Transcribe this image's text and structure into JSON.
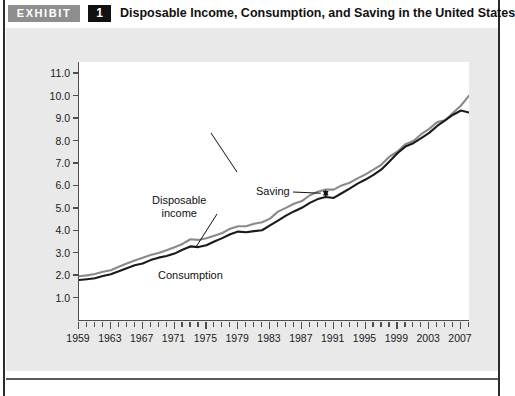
{
  "header": {
    "exhibit_label": "EXHIBIT",
    "exhibit_number": "1",
    "title": "Disposable Income, Consumption, and Saving in the United States"
  },
  "colors": {
    "panel_background": "#e9e9e9",
    "plot_background": "#ffffff",
    "axis": "#4d4d4d",
    "disposable_income_line": "#8a8a8a",
    "consumption_line": "#1a1a1a",
    "exhibit_badge": "#8e8e8e",
    "number_badge": "#111111",
    "text": "#1a1a1a"
  },
  "chart_data": {
    "type": "line",
    "title": "Disposable Income, Consumption, and Saving in the United States",
    "xlabel": "",
    "ylabel": "Trillions of 2005 dollars",
    "xlim": [
      1959,
      2008
    ],
    "ylim": [
      0.0,
      11.5
    ],
    "grid": false,
    "legend_position": "inline-annotations",
    "y_ticks": [
      "1.0",
      "2.0",
      "3.0",
      "4.0",
      "5.0",
      "6.0",
      "7.0",
      "8.0",
      "9.0",
      "10.0",
      "11.0"
    ],
    "y_tick_values": [
      1.0,
      2.0,
      3.0,
      4.0,
      5.0,
      6.0,
      7.0,
      8.0,
      9.0,
      10.0,
      11.0
    ],
    "x_ticks": [
      "1959",
      "1963",
      "1967",
      "1971",
      "1975",
      "1979",
      "1983",
      "1987",
      "1991",
      "1995",
      "1999",
      "2003",
      "2007"
    ],
    "x_tick_values": [
      1959,
      1963,
      1967,
      1971,
      1975,
      1979,
      1983,
      1987,
      1991,
      1995,
      1999,
      2003,
      2007
    ],
    "x_minor_tick_interval": 1,
    "x": [
      1959,
      1960,
      1961,
      1962,
      1963,
      1964,
      1965,
      1966,
      1967,
      1968,
      1969,
      1970,
      1971,
      1972,
      1973,
      1974,
      1975,
      1976,
      1977,
      1978,
      1979,
      1980,
      1981,
      1982,
      1983,
      1984,
      1985,
      1986,
      1987,
      1988,
      1989,
      1990,
      1991,
      1992,
      1993,
      1994,
      1995,
      1996,
      1997,
      1998,
      1999,
      2000,
      2001,
      2002,
      2003,
      2004,
      2005,
      2006,
      2007,
      2008
    ],
    "series": [
      {
        "name": "Disposable income",
        "color": "#8a8a8a",
        "values": [
          1.95,
          1.99,
          2.05,
          2.15,
          2.22,
          2.37,
          2.52,
          2.65,
          2.77,
          2.9,
          2.99,
          3.11,
          3.24,
          3.39,
          3.6,
          3.57,
          3.64,
          3.76,
          3.88,
          4.07,
          4.18,
          4.18,
          4.29,
          4.36,
          4.52,
          4.83,
          5.0,
          5.18,
          5.3,
          5.56,
          5.72,
          5.82,
          5.81,
          6.0,
          6.12,
          6.31,
          6.49,
          6.7,
          6.93,
          7.28,
          7.5,
          7.83,
          7.98,
          8.28,
          8.52,
          8.82,
          8.9,
          9.24,
          9.56,
          10.0
        ],
        "units": "trillions of 2005 dollars"
      },
      {
        "name": "Consumption",
        "color": "#1a1a1a",
        "values": [
          1.78,
          1.82,
          1.86,
          1.96,
          2.04,
          2.17,
          2.31,
          2.44,
          2.52,
          2.67,
          2.78,
          2.85,
          2.96,
          3.13,
          3.28,
          3.25,
          3.33,
          3.5,
          3.65,
          3.82,
          3.94,
          3.91,
          3.96,
          4.0,
          4.22,
          4.43,
          4.65,
          4.84,
          5.0,
          5.22,
          5.39,
          5.48,
          5.44,
          5.65,
          5.86,
          6.08,
          6.26,
          6.47,
          6.71,
          7.07,
          7.43,
          7.73,
          7.88,
          8.11,
          8.34,
          8.65,
          8.9,
          9.15,
          9.34,
          9.25
        ],
        "units": "trillions of 2005 dollars"
      }
    ],
    "annotations": [
      {
        "name": "disposable-income",
        "text": "Disposable\nincome",
        "label_line1": "Disposable",
        "label_line2": "income"
      },
      {
        "name": "consumption",
        "text": "Consumption",
        "label_line1": "Consumption"
      },
      {
        "name": "saving",
        "text": "Saving",
        "label_line1": "Saving",
        "note": "vertical gap between disposable income and consumption"
      }
    ]
  }
}
